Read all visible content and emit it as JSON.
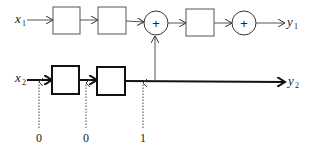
{
  "diagram": {
    "inputs": [
      {
        "id": "x1",
        "symbol": "x",
        "subscript": "1"
      },
      {
        "id": "x2",
        "symbol": "x",
        "subscript": "2"
      }
    ],
    "outputs": [
      {
        "id": "y1",
        "symbol": "y",
        "subscript": "1"
      },
      {
        "id": "y2",
        "symbol": "y",
        "subscript": "2"
      }
    ],
    "summers": [
      {
        "id": "sum1",
        "label": "+"
      },
      {
        "id": "sum2",
        "label": "+"
      }
    ],
    "top_blocks": 3,
    "bottom_blocks": 2,
    "control_inputs": [
      {
        "id": "c1",
        "value": "0"
      },
      {
        "id": "c2",
        "value": "0"
      },
      {
        "id": "c3",
        "value": "1"
      }
    ],
    "colors": {
      "stroke": "#222222",
      "thin_stroke": "#555555",
      "background": "#ffffff"
    }
  }
}
